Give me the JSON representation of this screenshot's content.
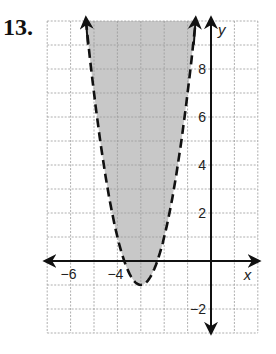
{
  "problem_number": "13.",
  "chart_data": {
    "type": "line",
    "title": "",
    "xlabel": "x",
    "ylabel": "y",
    "xlim": [
      -7,
      2
    ],
    "ylim": [
      -3,
      10
    ],
    "grid": true,
    "x_tick_labels": [
      {
        "value": -6,
        "label": "−6"
      },
      {
        "value": -4,
        "label": "−4"
      }
    ],
    "y_tick_labels": [
      {
        "value": 8,
        "label": "8"
      },
      {
        "value": 6,
        "label": "6"
      },
      {
        "value": 4,
        "label": "4"
      },
      {
        "value": 2,
        "label": "2"
      },
      {
        "value": -2,
        "label": "−2"
      }
    ],
    "series": [
      {
        "name": "boundary",
        "style": "dashed",
        "equation": "y = 2(x+3)^2 - 1",
        "vertex": [
          -3,
          -1
        ],
        "x": [
          -5.345,
          -5,
          -4.5,
          -4,
          -3.7,
          -3.5,
          -3,
          -2.5,
          -2.3,
          -2,
          -1.5,
          -1,
          -0.655
        ],
        "y": [
          10,
          7,
          3.5,
          1,
          0,
          -0.5,
          -1,
          -0.5,
          0,
          1,
          3.5,
          7,
          10
        ]
      }
    ],
    "shaded_region": "inside parabola (above curve)",
    "colors": {
      "shade": "#c8c8c8",
      "grid": "#9a9a9a",
      "axis": "#111111",
      "curve": "#111111"
    }
  }
}
